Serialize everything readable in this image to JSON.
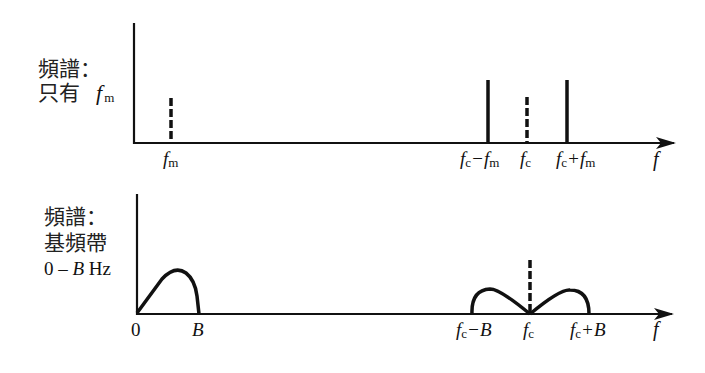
{
  "top_panel": {
    "label_line1": "頻譜：",
    "label_line2": "只有",
    "label_fm_italic": "f",
    "label_fm_sub": "m",
    "x_axis_label": "f",
    "ticks": [
      {
        "italic": "f",
        "sub": "m",
        "rest": ""
      },
      {
        "italic": "f",
        "sub": "c",
        "rest": "−",
        "italic2": "f",
        "sub2": "m"
      },
      {
        "italic": "f",
        "sub": "c",
        "rest": ""
      },
      {
        "italic": "f",
        "sub": "c",
        "rest": "+",
        "italic2": "f",
        "sub2": "m"
      }
    ]
  },
  "bottom_panel": {
    "label_line1": "頻譜：",
    "label_line2": "基頻帶",
    "label_line3_pre": "0 – ",
    "label_line3_B": "B",
    "label_line3_post": " Hz",
    "x_axis_label": "f",
    "ticks": [
      {
        "text": "0"
      },
      {
        "italic": "B"
      },
      {
        "italic": "f",
        "sub": "c",
        "rest": "−",
        "italic2": "B"
      },
      {
        "italic": "f",
        "sub": "c"
      },
      {
        "italic": "f",
        "sub": "c",
        "rest": "+",
        "italic2": "B"
      }
    ]
  },
  "colors": {
    "ink": "#111111",
    "background": "#ffffff"
  }
}
